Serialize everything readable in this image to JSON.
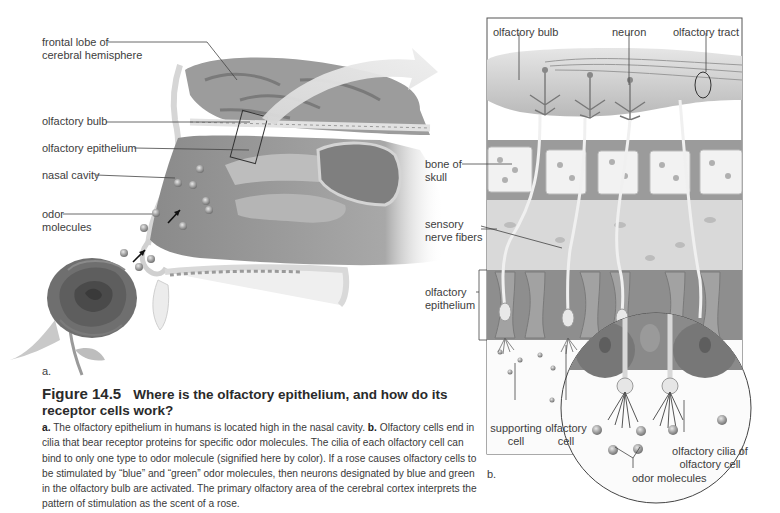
{
  "panel_a": {
    "labels": {
      "frontal_lobe_1": "frontal lobe of",
      "frontal_lobe_2": "cerebral hemisphere",
      "olfactory_bulb": "olfactory bulb",
      "olfactory_epithelium": "olfactory epithelium",
      "nasal_cavity": "nasal cavity",
      "odor_molecules_1": "odor",
      "odor_molecules_2": "molecules"
    },
    "panel_letter": "a."
  },
  "panel_b": {
    "labels": {
      "olfactory_bulb": "olfactory bulb",
      "neuron": "neuron",
      "olfactory_tract": "olfactory tract",
      "bone_of_skull_1": "bone of",
      "bone_of_skull_2": "skull",
      "sensory_nerve_fibers_1": "sensory",
      "sensory_nerve_fibers_2": "nerve fibers",
      "olfactory_epithelium_1": "olfactory",
      "olfactory_epithelium_2": "epithelium",
      "supporting_cell_1": "supporting",
      "supporting_cell_2": "cell",
      "olfactory_cell_1": "olfactory",
      "olfactory_cell_2": "cell",
      "olfactory_cilia_1": "olfactory cilia of",
      "olfactory_cilia_2": "olfactory cell",
      "odor_molecules": "odor molecules"
    },
    "panel_letter": "b."
  },
  "caption": {
    "figure_number": "Figure 14.5",
    "title": "Where is the olfactory epithelium, and how do its receptor cells work?",
    "a_marker": "a.",
    "a_text": " The olfactory epithelium in humans is located high in the nasal cavity. ",
    "b_marker": "b.",
    "b_text": " Olfactory cells end in cilia that bear receptor proteins for specific odor molecules. The cilia of each olfactory cell can bind to only one type to odor molecule (signified here by color). If a rose causes olfactory cells to be stimulated by “blue” and “green” odor molecules, then neurons designated by blue and green in the olfactory bulb are activated. The primary olfactory area of the cerebral cortex interprets the pattern of stimulation as the scent of a rose."
  }
}
